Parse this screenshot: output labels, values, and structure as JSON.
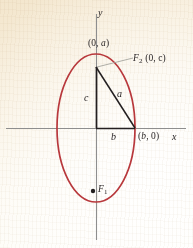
{
  "figure": {
    "background_color": "#fbf4e6",
    "curve_color": "#b8383c",
    "axis_color": "#8e8e8e",
    "ink_color": "#231f20"
  },
  "axes": {
    "x_label": "x",
    "y_label": "y",
    "origin": {
      "x": 96,
      "y": 128
    }
  },
  "ellipse": {
    "center": {
      "x": 96,
      "y": 128
    },
    "semi_minor_x": 39,
    "semi_major_y": 74,
    "stroke": "#b8383c",
    "stroke_width": 1.6
  },
  "points": [
    {
      "name": "top-vertex",
      "label": "(0, a)",
      "label_prefix": "(0, ",
      "label_italic": "a",
      "label_suffix": ")",
      "x": 96,
      "y": 54
    },
    {
      "name": "focus-upper",
      "label": "F2 (0, c)",
      "label_italic": "F",
      "label_sub": "2",
      "label_rest": " (0, c)",
      "x": 96,
      "y": 67
    },
    {
      "name": "right-vertex",
      "label": "(b, 0)",
      "label_prefix": "(",
      "label_italic": "b",
      "label_suffix": ", 0)",
      "x": 135,
      "y": 128
    },
    {
      "name": "focus-lower",
      "label": "F1",
      "label_italic": "F",
      "label_sub": "1",
      "x": 93,
      "y": 191
    }
  ],
  "segments": [
    {
      "name": "leg-c",
      "label": "c",
      "from": {
        "x": 96,
        "y": 67
      },
      "to": {
        "x": 96,
        "y": 128
      }
    },
    {
      "name": "leg-b",
      "label": "b",
      "from": {
        "x": 96,
        "y": 128
      },
      "to": {
        "x": 135,
        "y": 128
      }
    },
    {
      "name": "hypotenuse-a",
      "label": "a",
      "from": {
        "x": 96,
        "y": 67
      },
      "to": {
        "x": 135,
        "y": 128
      }
    }
  ],
  "segment_labels": {
    "c": "c",
    "b": "b",
    "a": "a"
  },
  "leader_line": {
    "name": "focus-upper-leader",
    "from": {
      "x": 96,
      "y": 67
    },
    "to": {
      "x": 131,
      "y": 58
    },
    "color": "#9a9a94"
  }
}
